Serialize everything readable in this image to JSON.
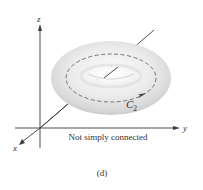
{
  "figure": {
    "panel_label": "(d)",
    "caption": "Not simply connected",
    "axes": {
      "x_label": "x",
      "y_label": "y",
      "z_label": "z"
    },
    "curve": {
      "label_main": "C",
      "label_sub": "2",
      "style": "dashed"
    },
    "surface": {
      "shape": "torus",
      "fill_color": "#e8e8e8",
      "highlight_color": "#fafafa",
      "shadow_color": "#c8c8c8"
    },
    "colors": {
      "axis": "#3a3a3a",
      "dash": "#555555",
      "text": "#333333"
    }
  }
}
